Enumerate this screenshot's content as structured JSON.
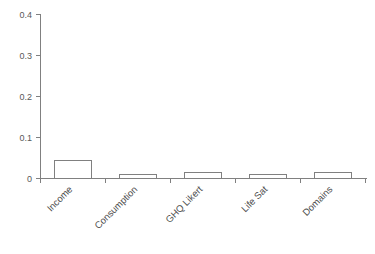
{
  "chart_data": {
    "type": "bar",
    "title": "",
    "subtitle": "",
    "xlabel": "",
    "ylabel": "",
    "categories": [
      "Income",
      "Consumption",
      "GHQ Likert",
      "Life Sat",
      "Domains"
    ],
    "values": [
      0.32,
      0.29,
      0.045,
      0.01,
      0.015
    ],
    "ylim": [
      0,
      0.4
    ],
    "ytick_labels": [
      "0",
      "0.1",
      "0.2",
      "0.3",
      "0.4"
    ],
    "ytick_values": [
      0,
      0.1,
      0.2,
      0.3,
      0.4
    ],
    "grid": false,
    "legend": null,
    "legend_position": "none",
    "bar_fill_color": "#ffffff",
    "bar_edge_color": "#808080",
    "axis_color": "#808080",
    "tick_label_color": "#595959",
    "category_label_color": "#4d4d4d",
    "category_label_rotation": 45,
    "background_color": "#ffffff"
  }
}
